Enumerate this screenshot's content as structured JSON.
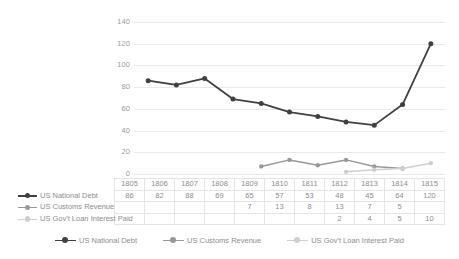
{
  "chart_data": {
    "type": "line",
    "title": "",
    "xlabel": "",
    "ylabel": "",
    "categories": [
      "1805",
      "1806",
      "1807",
      "1808",
      "1809",
      "1810",
      "1811",
      "1812",
      "1813",
      "1814",
      "1815"
    ],
    "ylim": [
      0,
      140
    ],
    "ytick_step": 20,
    "yticks": [
      "140",
      "120",
      "100",
      "80",
      "60",
      "40",
      "20",
      "0"
    ],
    "grid": true,
    "legend_position": "bottom",
    "data_table_visible": true,
    "series": [
      {
        "name": "US National Debt",
        "color": "#404040",
        "values": [
          86,
          82,
          88,
          69,
          65,
          57,
          53,
          48,
          45,
          64,
          120
        ],
        "display": [
          "86",
          "82",
          "88",
          "69",
          "65",
          "57",
          "53",
          "48",
          "45",
          "64",
          "120"
        ]
      },
      {
        "name": "US Customs Revenue",
        "color": "#989898",
        "values": [
          null,
          null,
          null,
          null,
          7,
          13,
          8,
          13,
          7,
          5,
          null
        ],
        "display": [
          "",
          "",
          "",
          "",
          "7",
          "13",
          "8",
          "13",
          "7",
          "5",
          ""
        ]
      },
      {
        "name": "US Gov't Loan Interest Paid",
        "color": "#cfcfcf",
        "values": [
          null,
          null,
          null,
          null,
          null,
          null,
          null,
          2,
          4,
          5,
          10
        ],
        "display": [
          "",
          "",
          "",
          "",
          "",
          "",
          "",
          "2",
          "4",
          "5",
          "10"
        ]
      }
    ]
  },
  "colors": {
    "gridline": "#e9e9e9",
    "table_border": "#e4e4e4",
    "text": "#8d8d8d",
    "axis_text": "#9a9a9a",
    "background": "#ffffff"
  }
}
